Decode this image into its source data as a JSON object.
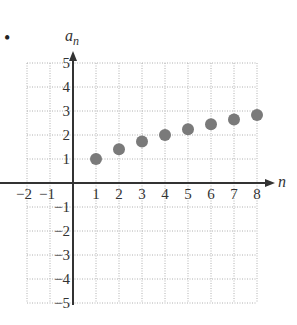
{
  "bullet": "•",
  "chart_data": {
    "type": "scatter",
    "title": "",
    "xlabel": "n",
    "ylabel": "a_n",
    "xlim": [
      -2,
      8
    ],
    "ylim": [
      -5,
      5
    ],
    "grid": true,
    "x_ticks": [
      -2,
      -1,
      1,
      2,
      3,
      4,
      5,
      6,
      7,
      8
    ],
    "y_ticks": [
      -5,
      -4,
      -3,
      -2,
      -1,
      1,
      2,
      3,
      4,
      5
    ],
    "x": [
      1,
      2,
      3,
      4,
      5,
      6,
      7,
      8
    ],
    "values": [
      1.0,
      1.41,
      1.73,
      2.0,
      2.24,
      2.45,
      2.65,
      2.83
    ],
    "point_color": "#7a7a7a",
    "axis_color": "#333333",
    "grid_color": "#b0b0b0"
  }
}
